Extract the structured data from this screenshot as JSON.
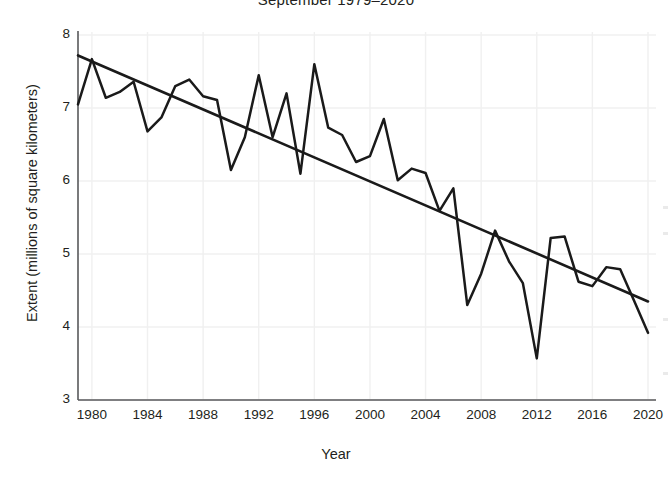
{
  "chart_data": {
    "type": "line",
    "title": "September 1979–2020",
    "xlabel": "Year",
    "ylabel": "Extent (millions of square kilometers)",
    "xlim": [
      1979,
      2020
    ],
    "ylim": [
      3,
      8
    ],
    "grid": true,
    "legend": null,
    "xticks": [
      1980,
      1984,
      1988,
      1992,
      1996,
      2000,
      2004,
      2008,
      2012,
      2016,
      2020
    ],
    "yticks": [
      3,
      4,
      5,
      6,
      7,
      8
    ],
    "x": [
      1979,
      1980,
      1981,
      1982,
      1983,
      1984,
      1985,
      1986,
      1987,
      1988,
      1989,
      1990,
      1991,
      1992,
      1993,
      1994,
      1995,
      1996,
      1997,
      1998,
      1999,
      2000,
      2001,
      2002,
      2003,
      2004,
      2005,
      2006,
      2007,
      2008,
      2009,
      2010,
      2011,
      2012,
      2013,
      2014,
      2015,
      2016,
      2017,
      2018,
      2019,
      2020
    ],
    "series": [
      {
        "name": "September sea ice extent",
        "kind": "line",
        "values": [
          7.05,
          7.67,
          7.14,
          7.22,
          7.36,
          6.68,
          6.87,
          7.3,
          7.39,
          7.16,
          7.11,
          6.15,
          6.6,
          7.45,
          6.6,
          7.2,
          6.1,
          7.6,
          6.73,
          6.63,
          6.26,
          6.34,
          6.85,
          6.01,
          6.17,
          6.11,
          5.59,
          5.9,
          4.3,
          4.73,
          5.32,
          4.9,
          4.6,
          3.57,
          5.22,
          5.24,
          4.62,
          4.56,
          4.82,
          4.79,
          4.36,
          3.92
        ]
      },
      {
        "name": "Linear trend",
        "kind": "trend",
        "endpoints": [
          {
            "x": 1979,
            "y": 7.72
          },
          {
            "x": 2020,
            "y": 4.35
          }
        ]
      }
    ]
  },
  "axis": {
    "y_tick_labels": [
      "8",
      "7",
      "6",
      "5",
      "4",
      "3"
    ],
    "x_tick_labels": [
      "1980",
      "1984",
      "1988",
      "1992",
      "1996",
      "2000",
      "2004",
      "2008",
      "2012",
      "2016",
      "2020"
    ]
  },
  "colors": {
    "line": "#1a1a1a",
    "trend": "#1a1a1a",
    "axis": "#58595b",
    "grid": "#f0f0f0",
    "text": "#231f20",
    "background": "#ffffff"
  }
}
